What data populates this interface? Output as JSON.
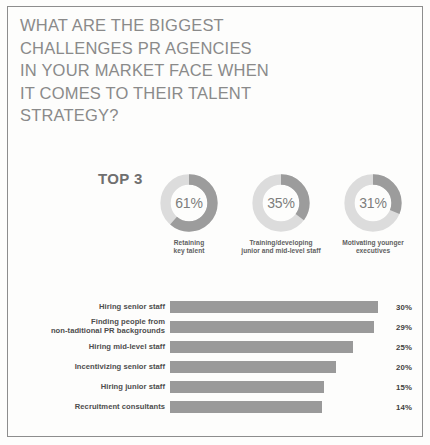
{
  "title": {
    "lines": [
      "WHAT ARE THE BIGGEST",
      "CHALLENGES PR AGENCIES",
      "IN YOUR MARKET FACE WHEN",
      "IT COMES TO THEIR TALENT",
      "STRATEGY?"
    ]
  },
  "top3": {
    "label": "TOP 3"
  },
  "colors": {
    "arc_active": "#9c9c9c",
    "arc_track": "#dcdcdc",
    "bar_fill": "#9a9a9a",
    "title_text": "#8a8a8a",
    "frame": "#8d8d8d"
  },
  "chart_data": [
    {
      "type": "pie",
      "title": "TOP 3",
      "subtype": "donut",
      "legend": "none",
      "slices": [
        {
          "label": "Retaining key talent",
          "caption_lines": [
            "Retaining",
            "key talent"
          ],
          "value": 61,
          "display": "61%"
        },
        {
          "label": "Training/developing junior and mid-level staff",
          "caption_lines": [
            "Training/developing",
            "junior and mid-level staff"
          ],
          "value": 35,
          "display": "35%"
        },
        {
          "label": "Motivating younger executives",
          "caption_lines": [
            "Motivating younger",
            "executives"
          ],
          "value": 31,
          "display": "31%"
        }
      ]
    },
    {
      "type": "bar",
      "orientation": "horizontal",
      "title": "",
      "xlabel": "",
      "ylabel": "",
      "xlim": [
        0,
        30
      ],
      "grid": false,
      "legend": "none",
      "categories": [
        "Hiring senior staff",
        "Finding people from non-taditional PR backgrounds",
        "Hiring mid-level staff",
        "Incentivizing senior staff",
        "Hiring junior staff",
        "Recruitment consultants"
      ],
      "values": [
        30,
        29,
        25,
        20,
        15,
        14
      ],
      "value_labels": [
        "30%",
        "29%",
        "25%",
        "20%",
        "15%",
        "14%"
      ]
    }
  ],
  "bar_rows": [
    {
      "label_lines": [
        "Hiring senior staff"
      ],
      "value": 30,
      "display": "30%",
      "width_pct": 100
    },
    {
      "label_lines": [
        "Finding people from",
        "non-taditional PR backgrounds"
      ],
      "value": 29,
      "display": "29%",
      "width_pct": 98
    },
    {
      "label_lines": [
        "Hiring mid-level staff"
      ],
      "value": 25,
      "display": "25%",
      "width_pct": 88
    },
    {
      "label_lines": [
        "Incentivizing senior staff"
      ],
      "value": 20,
      "display": "20%",
      "width_pct": 80
    },
    {
      "label_lines": [
        "Hiring junior staff"
      ],
      "value": 15,
      "display": "15%",
      "width_pct": 74
    },
    {
      "label_lines": [
        "Recruitment consultants"
      ],
      "value": 14,
      "display": "14%",
      "width_pct": 73
    }
  ]
}
